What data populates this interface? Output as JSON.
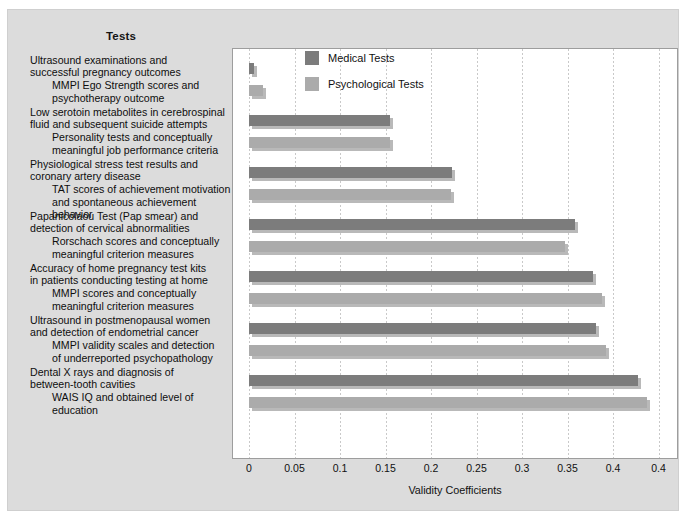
{
  "heading": "Tests",
  "legend": {
    "items": [
      {
        "label": "Medical Tests",
        "color": "#7c7c7c",
        "key": "medical"
      },
      {
        "label": "Psychological Tests",
        "color": "#ababab",
        "key": "psychological"
      }
    ]
  },
  "groups": [
    {
      "medical_label": "Ultrasound examinations and\nsuccessful pregnancy outcomes",
      "psych_label": "MMPI Ego Strength scores and\npsychotherapy outcome"
    },
    {
      "medical_label": "Low serotoin metabolites in cerebrospinal\nfluid and subsequent suicide attempts",
      "psych_label": "Personality tests and conceptually\nmeaningful job performance criteria"
    },
    {
      "medical_label": "Physiological stress test results and\ncoronary artery disease",
      "psych_label": "TAT scores of achievement motivation\nand spontaneous achievement behavior"
    },
    {
      "medical_label": "Papanicolaou Test (Pap smear) and\ndetection of cervical abnormalities",
      "psych_label": "Rorschach scores and conceptually\nmeaningful criterion measures"
    },
    {
      "medical_label": "Accuracy of home pregnancy test kits\nin patients conducting testing at home",
      "psych_label": "MMPI scores and conceptually\nmeaningful criterion measures"
    },
    {
      "medical_label": "Ultrasound in postmenopausal women\nand detection of endometrial cancer",
      "psych_label": "MMPI validity scales and detection\nof underreported psychopathology"
    },
    {
      "medical_label": "Dental X rays and diagnosis of\nbetween-tooth cavities",
      "psych_label": "WAIS IQ and obtained level of\neducation"
    }
  ],
  "chart_data": {
    "type": "bar",
    "orientation": "horizontal",
    "title": "",
    "xlabel": "Validity Coefficients",
    "ylabel": "Tests",
    "xlim": [
      0,
      0.47
    ],
    "grid": "vertical-dotted",
    "legend_position": "top-right-inside",
    "xticks": [
      "0",
      "0.05",
      "0.1",
      "0.15",
      "0.2",
      "0.25",
      "0.3",
      "0.35",
      "0.4",
      "0.4"
    ],
    "xtick_values": [
      0,
      0.05,
      0.1,
      0.15,
      0.2,
      0.25,
      0.3,
      0.35,
      0.4,
      0.45
    ],
    "categories": [
      "Ultrasound examinations and successful pregnancy outcomes / MMPI Ego Strength scores and psychotherapy outcome",
      "Low serotoin metabolites in cerebrospinal fluid and subsequent suicide attempts / Personality tests and conceptually meaningful job performance criteria",
      "Physiological stress test results and coronary artery disease / TAT scores of achievement motivation and spontaneous achievement behavior",
      "Papanicolaou Test (Pap smear) and detection of cervical abnormalities / Rorschach scores and conceptually meaningful criterion measures",
      "Accuracy of home pregnancy test kits in patients conducting testing at home / MMPI scores and conceptually meaningful criterion measures",
      "Ultrasound in postmenopausal women and detection of endometrial cancer / MMPI validity scales and detection of underreported psychopathology",
      "Dental X rays and diagnosis of between-tooth cavities / WAIS IQ and obtained level of education"
    ],
    "series": [
      {
        "name": "Medical Tests",
        "color": "#7c7c7c",
        "values": [
          0.005,
          0.155,
          0.223,
          0.358,
          0.378,
          0.381,
          0.427
        ]
      },
      {
        "name": "Psychological Tests",
        "color": "#ababab",
        "values": [
          0.015,
          0.155,
          0.222,
          0.347,
          0.388,
          0.392,
          0.437
        ]
      }
    ]
  }
}
